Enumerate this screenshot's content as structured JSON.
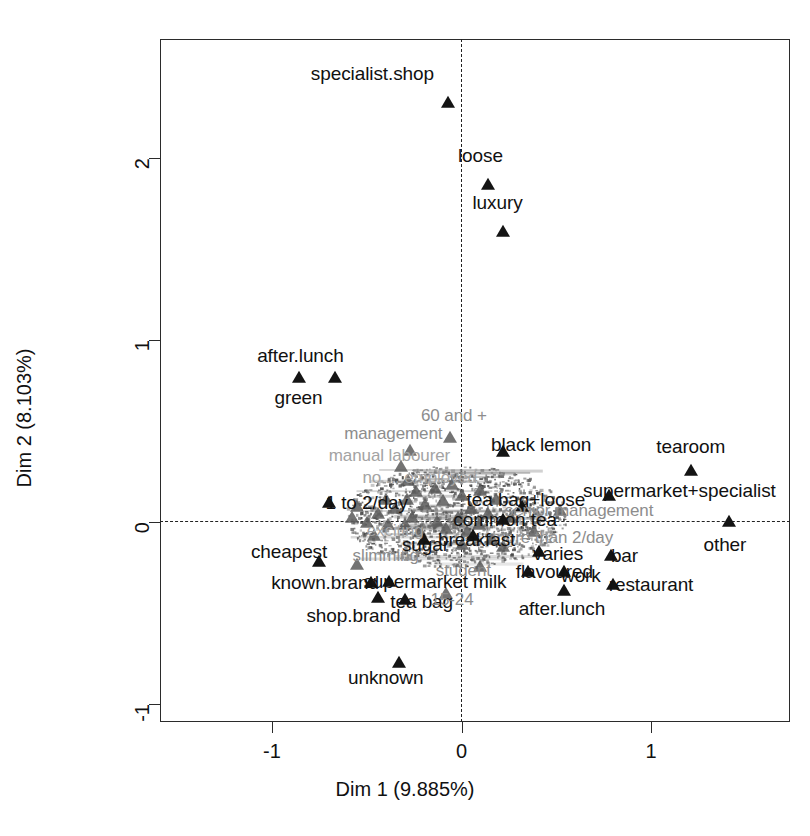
{
  "chart_data": {
    "type": "scatter",
    "title": "",
    "xlabel": "Dim 1 (9.885%)",
    "ylabel": "Dim 2 (8.103%)",
    "xlim": [
      -1.59,
      1.73
    ],
    "ylim": [
      -1.27,
      2.65
    ],
    "xticks": [
      -1,
      0,
      1
    ],
    "xticklabels": [
      "-1",
      "0",
      "1"
    ],
    "yticks": [
      -1,
      0,
      1,
      2
    ],
    "yticklabels": [
      "-1",
      "0",
      "1",
      "2"
    ],
    "grid": false,
    "legend": null,
    "reference_lines": [
      {
        "axis": "x",
        "value": 0,
        "style": "dashed"
      },
      {
        "axis": "y",
        "value": 0,
        "style": "dashed"
      }
    ],
    "marker": "triangle",
    "marker_color": "#141414",
    "points": [
      {
        "label": "specialist.shop",
        "x": -0.07,
        "y": 2.3,
        "label_dx": -0.4,
        "label_dy": 0.16,
        "emphasis": "dark"
      },
      {
        "label": "loose",
        "x": 0.14,
        "y": 1.85,
        "label_dx": -0.04,
        "label_dy": 0.16,
        "emphasis": "dark"
      },
      {
        "label": "luxury",
        "x": 0.22,
        "y": 1.59,
        "label_dx": -0.03,
        "label_dy": 0.16,
        "emphasis": "dark"
      },
      {
        "label": "after.lunch",
        "x": -0.86,
        "y": 0.79,
        "label_dx": 0.01,
        "label_dy": 0.12,
        "emphasis": "dark"
      },
      {
        "label": "green",
        "x": -0.67,
        "y": 0.79,
        "label_dx": -0.19,
        "label_dy": -0.11,
        "emphasis": "dark"
      },
      {
        "label": "60 and +",
        "x": -0.06,
        "y": 0.46,
        "label_dx": 0.02,
        "label_dy": 0.12,
        "emphasis": "dim"
      },
      {
        "label": "management",
        "x": -0.27,
        "y": 0.39,
        "label_dx": -0.09,
        "label_dy": 0.09,
        "emphasis": "dim"
      },
      {
        "label": "manual labourer",
        "x": -0.32,
        "y": 0.3,
        "label_dx": -0.06,
        "label_dy": 0.06,
        "emphasis": "dimmer"
      },
      {
        "label": "black lemon",
        "x": 0.22,
        "y": 0.38,
        "label_dx": 0.2,
        "label_dy": 0.04,
        "emphasis": "dark"
      },
      {
        "label": "tearoom",
        "x": 1.21,
        "y": 0.28,
        "label_dx": 0.0,
        "label_dy": 0.13,
        "emphasis": "dark"
      },
      {
        "label": "supermarket+specialist",
        "x": 0.78,
        "y": 0.14,
        "label_dx": 0.37,
        "label_dy": 0.03,
        "emphasis": "dark"
      },
      {
        "label": "no ... employed",
        "x": -0.28,
        "y": 0.22,
        "label_dx": 0.06,
        "label_dy": 0.02,
        "emphasis": "dimmer"
      },
      {
        "label": "1 to 2/day",
        "x": -0.7,
        "y": 0.1,
        "label_dx": 0.2,
        "label_dy": 0.0,
        "emphasis": "dark"
      },
      {
        "label": "tea bag+loose",
        "x": 0.32,
        "y": 0.08,
        "label_dx": 0.02,
        "label_dy": 0.04,
        "emphasis": "dark"
      },
      {
        "label": "senior management",
        "x": 0.52,
        "y": 0.06,
        "label_dx": 0.1,
        "label_dy": 0.0,
        "emphasis": "dim"
      },
      {
        "label": "common tea",
        "x": 0.22,
        "y": 0.01,
        "label_dx": 0.01,
        "label_dy": 0.0,
        "emphasis": "dark"
      },
      {
        "label": "more than 2/day",
        "x": 0.38,
        "y": -0.06,
        "label_dx": 0.1,
        "label_dy": -0.03,
        "emphasis": "dim"
      },
      {
        "label": "other",
        "x": 1.41,
        "y": 0.0,
        "label_dx": -0.02,
        "label_dy": -0.13,
        "emphasis": "dark"
      },
      {
        "label": "breakfast",
        "x": 0.06,
        "y": -0.08,
        "label_dx": 0.02,
        "label_dy": -0.02,
        "emphasis": "dark"
      },
      {
        "label": "sugar",
        "x": -0.2,
        "y": -0.1,
        "label_dx": 0.01,
        "label_dy": -0.03,
        "emphasis": "dark"
      },
      {
        "label": "exciting",
        "x": -0.39,
        "y": -0.02,
        "label_dx": 0.04,
        "label_dy": -0.03,
        "emphasis": "dimmer"
      },
      {
        "label": "varies",
        "x": 0.41,
        "y": -0.17,
        "label_dx": 0.1,
        "label_dy": -0.01,
        "emphasis": "dark"
      },
      {
        "label": "bar",
        "x": 0.79,
        "y": -0.19,
        "label_dx": 0.07,
        "label_dy": 0.0,
        "emphasis": "dark"
      },
      {
        "label": "cheapest",
        "x": -0.75,
        "y": -0.22,
        "label_dx": -0.16,
        "label_dy": 0.05,
        "emphasis": "dark"
      },
      {
        "label": "slimming",
        "x": -0.55,
        "y": -0.24,
        "label_dx": 0.15,
        "label_dy": 0.05,
        "emphasis": "dim"
      },
      {
        "label": "student",
        "x": 0.1,
        "y": -0.25,
        "label_dx": -0.09,
        "label_dy": -0.02,
        "emphasis": "dim"
      },
      {
        "label": "flavoured",
        "x": 0.35,
        "y": -0.28,
        "label_dx": 0.14,
        "label_dy": 0.0,
        "emphasis": "dark"
      },
      {
        "label": "work",
        "x": 0.54,
        "y": -0.28,
        "label_dx": 0.09,
        "label_dy": -0.02,
        "emphasis": "dark"
      },
      {
        "label": "known.brand",
        "x": -0.48,
        "y": -0.34,
        "label_dx": -0.24,
        "label_dy": 0.0,
        "emphasis": "dark"
      },
      {
        "label": "supermarket milk",
        "x": -0.38,
        "y": -0.33,
        "label_dx": 0.24,
        "label_dy": 0.0,
        "emphasis": "dark"
      },
      {
        "label": "after.lunch",
        "x": 0.54,
        "y": -0.38,
        "label_dx": -0.01,
        "label_dy": -0.1,
        "emphasis": "dark"
      },
      {
        "label": "restaurant",
        "x": 0.8,
        "y": -0.35,
        "label_dx": 0.2,
        "label_dy": 0.0,
        "emphasis": "dark"
      },
      {
        "label": "shop.brand",
        "x": -0.44,
        "y": -0.42,
        "label_dx": -0.13,
        "label_dy": -0.1,
        "emphasis": "dark"
      },
      {
        "label": "tea bag",
        "x": -0.3,
        "y": -0.43,
        "label_dx": 0.09,
        "label_dy": -0.01,
        "emphasis": "dark"
      },
      {
        "label": "15-24",
        "x": -0.08,
        "y": -0.4,
        "label_dx": 0.03,
        "label_dy": -0.03,
        "emphasis": "dim"
      },
      {
        "label": "unknown",
        "x": -0.33,
        "y": -0.78,
        "label_dx": -0.07,
        "label_dy": -0.08,
        "emphasis": "dark"
      }
    ],
    "extra_markers": [
      {
        "x": -0.58,
        "y": 0.02
      },
      {
        "x": -0.5,
        "y": -0.01
      },
      {
        "x": -0.44,
        "y": 0.04
      },
      {
        "x": -0.35,
        "y": 0.07
      },
      {
        "x": -0.29,
        "y": 0.12
      },
      {
        "x": -0.24,
        "y": 0.16
      },
      {
        "x": -0.19,
        "y": 0.09
      },
      {
        "x": -0.14,
        "y": 0.18
      },
      {
        "x": -0.1,
        "y": 0.11
      },
      {
        "x": -0.05,
        "y": 0.2
      },
      {
        "x": 0.0,
        "y": 0.14
      },
      {
        "x": 0.05,
        "y": 0.07
      },
      {
        "x": 0.1,
        "y": 0.17
      },
      {
        "x": 0.14,
        "y": 0.04
      },
      {
        "x": 0.18,
        "y": 0.12
      },
      {
        "x": -0.02,
        "y": 0.02
      },
      {
        "x": -0.08,
        "y": -0.04
      },
      {
        "x": -0.13,
        "y": 0.0
      },
      {
        "x": 0.03,
        "y": -0.06
      },
      {
        "x": 0.09,
        "y": -0.02
      },
      {
        "x": -0.22,
        "y": -0.06
      },
      {
        "x": -0.3,
        "y": -0.02
      },
      {
        "x": 0.16,
        "y": -0.1
      },
      {
        "x": 0.22,
        "y": -0.14
      },
      {
        "x": -0.26,
        "y": 0.02
      },
      {
        "x": -0.4,
        "y": 0.12
      },
      {
        "x": 0.26,
        "y": 0.02
      },
      {
        "x": -0.55,
        "y": 0.08
      },
      {
        "x": -0.46,
        "y": -0.08
      },
      {
        "x": 0.0,
        "y": -0.13
      }
    ]
  },
  "axes": {
    "x_title": "Dim 1 (9.885%)",
    "y_title": "Dim 2 (8.103%)"
  }
}
